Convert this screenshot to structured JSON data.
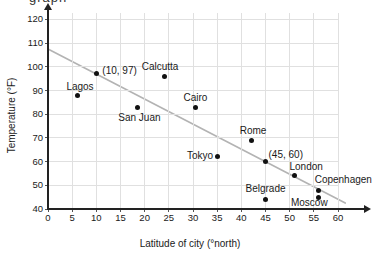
{
  "top_clipped_text": "graph",
  "chart_data": {
    "type": "scatter",
    "title": "",
    "xlabel": "Latitude of city (°north)",
    "ylabel": "Temperature (°F)",
    "xlim": [
      0,
      60
    ],
    "ylim": [
      40,
      120
    ],
    "x_ticks": [
      0,
      5,
      10,
      15,
      20,
      25,
      30,
      35,
      40,
      45,
      50,
      55,
      60
    ],
    "y_ticks": [
      40,
      50,
      60,
      70,
      80,
      90,
      100,
      110,
      120
    ],
    "grid": true,
    "legend": "none",
    "points": [
      {
        "name": "lagos",
        "label": "Lagos",
        "x": 6,
        "y": 88,
        "dx": 3,
        "dy": -8,
        "anchor": "center"
      },
      {
        "name": "point-10-97",
        "label": "(10, 97)",
        "x": 10,
        "y": 97,
        "dx": 6,
        "dy": -3,
        "anchor": "left"
      },
      {
        "name": "san-juan",
        "label": "San Juan",
        "x": 18.5,
        "y": 83,
        "dx": 2,
        "dy": 11,
        "anchor": "center"
      },
      {
        "name": "calcutta",
        "label": "Calcutta",
        "x": 24,
        "y": 96,
        "dx": -4,
        "dy": -9,
        "anchor": "center"
      },
      {
        "name": "cairo",
        "label": "Cairo",
        "x": 30.5,
        "y": 83,
        "dx": 0,
        "dy": -9,
        "anchor": "center"
      },
      {
        "name": "tokyo",
        "label": "Tokyo",
        "x": 35,
        "y": 62,
        "dx": -4,
        "dy": -1,
        "anchor": "right"
      },
      {
        "name": "rome",
        "label": "Rome",
        "x": 42,
        "y": 69,
        "dx": 2,
        "dy": -9,
        "anchor": "center"
      },
      {
        "name": "point-45-60",
        "label": "(45, 60)",
        "x": 45,
        "y": 60,
        "dx": 3,
        "dy": -7,
        "anchor": "left"
      },
      {
        "name": "london",
        "label": "London",
        "x": 51,
        "y": 54,
        "dx": -5,
        "dy": -9,
        "anchor": "left"
      },
      {
        "name": "belgrade",
        "label": "Belgrade",
        "x": 45,
        "y": 44,
        "dx": 0,
        "dy": -11,
        "anchor": "center"
      },
      {
        "name": "copenhagen",
        "label": "Copenhagen",
        "x": 56,
        "y": 48,
        "dx": -4,
        "dy": -10,
        "anchor": "left"
      },
      {
        "name": "moscow",
        "label": "Moscow",
        "x": 56,
        "y": 45,
        "dx": 9,
        "dy": 6,
        "anchor": "right"
      }
    ],
    "line_of_fit": {
      "x1": 0,
      "y1": 107.5,
      "x2": 61.5,
      "y2": 42.5
    },
    "colors": {
      "dot": "#111111",
      "line_of_fit": "#b3b3b3",
      "grid": "#e0e0e0",
      "axis": "#222222",
      "text": "#1a1a1a"
    }
  }
}
